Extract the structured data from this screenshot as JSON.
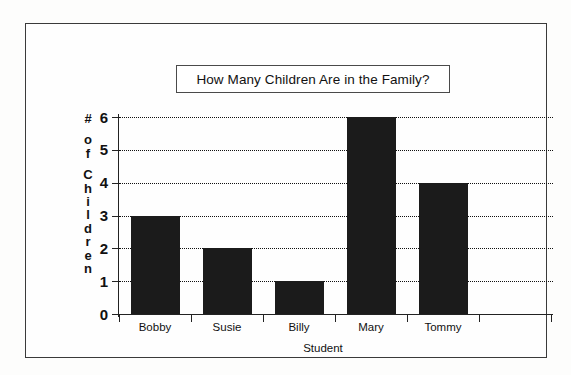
{
  "chart_data": {
    "type": "bar",
    "title": "How Many Children Are in the Family?",
    "xlabel": "Student",
    "ylabel": "# of Children",
    "ylabel_chars": [
      "#",
      "o",
      "f",
      "C",
      "h",
      "i",
      "l",
      "d",
      "r",
      "e",
      "n"
    ],
    "categories": [
      "Bobby",
      "Susie",
      "Billy",
      "Mary",
      "Tommy"
    ],
    "values": [
      3,
      2,
      1,
      6,
      4
    ],
    "ylim": [
      0,
      6
    ],
    "yticks": [
      0,
      1,
      2,
      3,
      4,
      5,
      6
    ],
    "ytick_labels": [
      "0",
      "1",
      "2",
      "3",
      "4",
      "5",
      "6"
    ],
    "grid": true,
    "grid_style": "dotted-horizontal",
    "legend": null,
    "bar_color": "#1b1b1b",
    "background_color": "#ffffff",
    "axis_color": "#222222",
    "empty_trailing_slot": true
  }
}
